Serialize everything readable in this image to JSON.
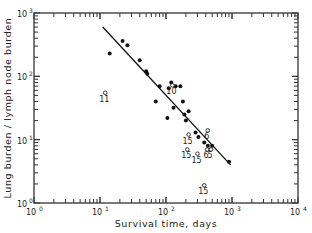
{
  "chart_data": {
    "type": "scatter",
    "title": "",
    "xlabel": "Survival time,  days",
    "ylabel": "Lung burden / lymph node burden",
    "xscale": "log",
    "yscale": "log",
    "xlim": [
      1,
      10000
    ],
    "ylim": [
      1,
      1000
    ],
    "x_ticks": [
      "10^0",
      "10^1",
      "10^2",
      "10^3",
      "10^4"
    ],
    "y_ticks": [
      "10^0",
      "10^1",
      "10^2",
      "10^3"
    ],
    "grid": false,
    "legend": null,
    "series": [
      {
        "name": "filled points",
        "marker": "filled-circle",
        "points": [
          {
            "x": 14,
            "y": 230
          },
          {
            "x": 22,
            "y": 360
          },
          {
            "x": 26,
            "y": 310
          },
          {
            "x": 40,
            "y": 180
          },
          {
            "x": 50,
            "y": 120
          },
          {
            "x": 52,
            "y": 110
          },
          {
            "x": 70,
            "y": 40
          },
          {
            "x": 80,
            "y": 70
          },
          {
            "x": 105,
            "y": 22
          },
          {
            "x": 110,
            "y": 65
          },
          {
            "x": 120,
            "y": 80
          },
          {
            "x": 130,
            "y": 32
          },
          {
            "x": 140,
            "y": 70
          },
          {
            "x": 165,
            "y": 70
          },
          {
            "x": 180,
            "y": 40
          },
          {
            "x": 190,
            "y": 25
          },
          {
            "x": 200,
            "y": 20
          },
          {
            "x": 220,
            "y": 28
          },
          {
            "x": 280,
            "y": 13
          },
          {
            "x": 310,
            "y": 11
          },
          {
            "x": 380,
            "y": 9
          },
          {
            "x": 430,
            "y": 8
          },
          {
            "x": 470,
            "y": 7
          },
          {
            "x": 500,
            "y": 8
          },
          {
            "x": 900,
            "y": 4.5
          }
        ]
      },
      {
        "name": "open points (labeled)",
        "marker": "open-circle",
        "points": [
          {
            "x": 12,
            "y": 55,
            "label": "11"
          },
          {
            "x": 125,
            "y": 72,
            "label": "10"
          },
          {
            "x": 220,
            "y": 12,
            "label": "15"
          },
          {
            "x": 210,
            "y": 7,
            "label": "15"
          },
          {
            "x": 300,
            "y": 6,
            "label": "15"
          },
          {
            "x": 430,
            "y": 14,
            "label": "6"
          },
          {
            "x": 420,
            "y": 7,
            "label": "6"
          },
          {
            "x": 480,
            "y": 7,
            "label": "5"
          },
          {
            "x": 380,
            "y": 1.9,
            "label": "15"
          }
        ]
      }
    ],
    "regression_line": {
      "x": [
        11,
        950
      ],
      "y": [
        600,
        4
      ]
    }
  }
}
